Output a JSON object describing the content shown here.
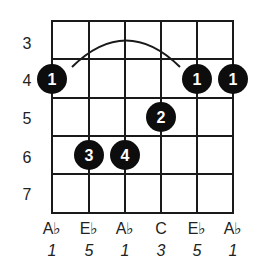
{
  "chord": {
    "name": "Ab major",
    "frets": [
      "3",
      "4",
      "5",
      "6",
      "7"
    ],
    "strings": [
      {
        "note": "A♭",
        "interval": "1"
      },
      {
        "note": "E♭",
        "interval": "5"
      },
      {
        "note": "A♭",
        "interval": "1"
      },
      {
        "note": "C",
        "interval": "3"
      },
      {
        "note": "E♭",
        "interval": "5"
      },
      {
        "note": "A♭",
        "interval": "1"
      }
    ],
    "dots": [
      {
        "string": 0,
        "fret_row": 1,
        "finger": "1"
      },
      {
        "string": 4,
        "fret_row": 1,
        "finger": "1"
      },
      {
        "string": 5,
        "fret_row": 1,
        "finger": "1"
      },
      {
        "string": 3,
        "fret_row": 2,
        "finger": "2"
      },
      {
        "string": 1,
        "fret_row": 3,
        "finger": "3"
      },
      {
        "string": 2,
        "fret_row": 3,
        "finger": "4"
      }
    ],
    "barre": {
      "from_string": 0,
      "to_string": 4,
      "fret_row": 1
    },
    "colors": {
      "line": "#1a1a1a",
      "dot": "#0d0d0d",
      "dot_text": "#ffffff"
    }
  }
}
